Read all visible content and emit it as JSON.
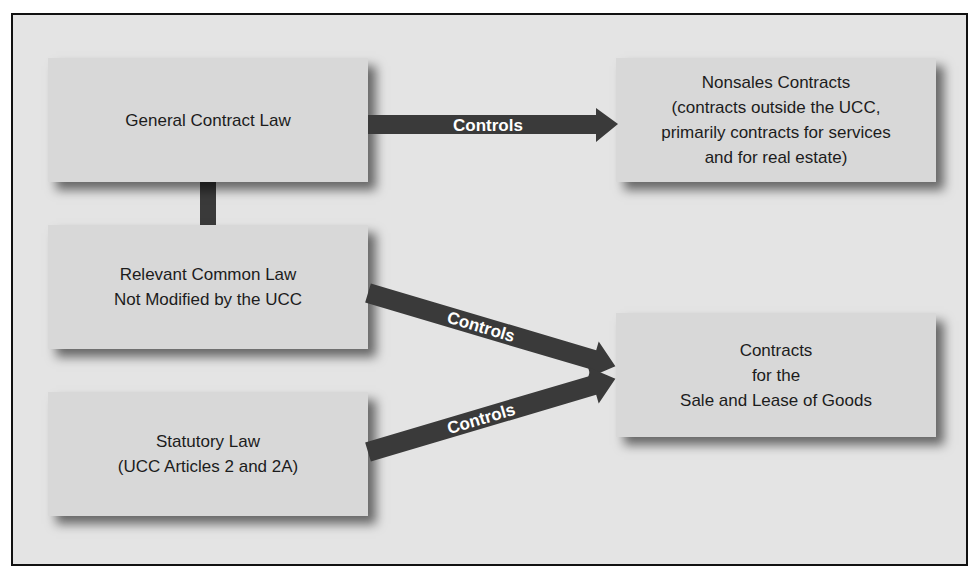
{
  "diagram": {
    "nodes": [
      {
        "id": "general",
        "label": "General Contract Law"
      },
      {
        "id": "common",
        "label": "Relevant Common Law\nNot Modified by the UCC"
      },
      {
        "id": "statutory",
        "label": "Statutory Law\n(UCC Articles 2 and 2A)"
      },
      {
        "id": "nonsales",
        "label": "Nonsales Contracts\n(contracts outside the UCC,\nprimarily contracts for services\nand for real estate)"
      },
      {
        "id": "goods",
        "label": "Contracts\nfor the\nSale and Lease of Goods"
      }
    ],
    "edges": [
      {
        "from": "general",
        "to": "nonsales",
        "label": "Controls"
      },
      {
        "from": "common",
        "to": "goods",
        "label": "Controls"
      },
      {
        "from": "statutory",
        "to": "goods",
        "label": "Controls"
      },
      {
        "from": "general",
        "to": "common",
        "label": ""
      }
    ]
  },
  "colors": {
    "frame_bg": "#e4e4e4",
    "box_bg": "#d8d8d8",
    "arrow": "#3a3a3a",
    "arrow_text": "#ffffff",
    "text": "#1c1c1c"
  }
}
